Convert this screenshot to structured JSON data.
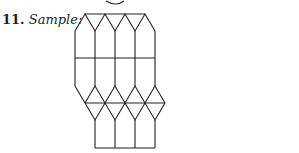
{
  "exercise": {
    "number": "11.",
    "label": "Sample:"
  },
  "figure": {
    "stroke_color": "#231f20",
    "partial_circle_at_top": true
  }
}
